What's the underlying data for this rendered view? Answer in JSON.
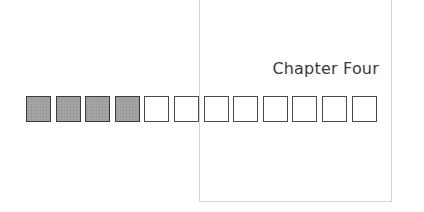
{
  "page": {
    "title": "Chapter Four"
  },
  "progress": {
    "total": 12,
    "filled": 4,
    "fill_color": "#a3a3a3",
    "border_color": "#4a4a4a"
  }
}
